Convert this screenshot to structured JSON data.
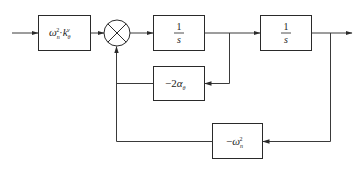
{
  "diagram": {
    "type": "control-system block diagram",
    "blocks": [
      {
        "id": "gain_in",
        "label_main": "ω",
        "label_sub": "n",
        "label_sup": "2",
        "label_dot": "·",
        "label_k": "k",
        "label_k_sub": "θ",
        "label_k_sup": "v"
      },
      {
        "id": "integrator_1",
        "numerator": "1",
        "denominator": "s"
      },
      {
        "id": "integrator_2",
        "numerator": "1",
        "denominator": "s"
      },
      {
        "id": "damping_feedback",
        "label_prefix": "−2",
        "label_main": "α",
        "label_sub": "θ"
      },
      {
        "id": "stiffness_feedback",
        "label_prefix": "−",
        "label_main": "ω",
        "label_sub": "n",
        "label_sup": "2"
      }
    ],
    "summing_junction": {
      "symbol": "⊗"
    },
    "colors": {
      "line": "#3a3a3a",
      "box": "#2a2a2a",
      "background": "#ffffff"
    }
  }
}
